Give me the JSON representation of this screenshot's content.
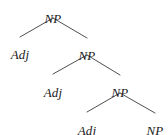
{
  "figure": {
    "name": "syntax-tree-diagram",
    "type": "constituency-tree",
    "background_color": "#ffffff",
    "edge_color": "#3a3a3a",
    "text_color": "#1a1a1a",
    "width": 168,
    "height": 135
  },
  "nodes": [
    {
      "id": "np1",
      "label": "NP",
      "depth": 0,
      "x": 53,
      "y": 12,
      "role": "root"
    },
    {
      "id": "adj1",
      "label": "Adj",
      "depth": 1,
      "x": 20,
      "y": 48,
      "role": "leaf"
    },
    {
      "id": "np2",
      "label": "NP",
      "depth": 1,
      "x": 87,
      "y": 49,
      "role": "branch"
    },
    {
      "id": "adj2",
      "label": "Adj",
      "depth": 2,
      "x": 53,
      "y": 86,
      "role": "leaf"
    },
    {
      "id": "np3",
      "label": "NP",
      "depth": 2,
      "x": 120,
      "y": 86,
      "role": "branch"
    },
    {
      "id": "adj3",
      "label": "Adj",
      "depth": 3,
      "x": 87,
      "y": 124,
      "role": "leaf"
    },
    {
      "id": "np4",
      "label": "NP",
      "depth": 3,
      "x": 155,
      "y": 124,
      "role": "leaf"
    }
  ],
  "edges": [
    {
      "id": "e1",
      "from": "np1",
      "to": "adj1",
      "x1": 53,
      "y1": 18,
      "x2": 20,
      "y2": 37
    },
    {
      "id": "e2",
      "from": "np1",
      "to": "np2",
      "x1": 53,
      "y1": 18,
      "x2": 87,
      "y2": 38
    },
    {
      "id": "e3",
      "from": "np2",
      "to": "adj2",
      "x1": 87,
      "y1": 55,
      "x2": 53,
      "y2": 74
    },
    {
      "id": "e4",
      "from": "np2",
      "to": "np3",
      "x1": 87,
      "y1": 55,
      "x2": 120,
      "y2": 75
    },
    {
      "id": "e5",
      "from": "np3",
      "to": "adj3",
      "x1": 120,
      "y1": 93,
      "x2": 87,
      "y2": 112
    },
    {
      "id": "e6",
      "from": "np3",
      "to": "np4",
      "x1": 120,
      "y1": 93,
      "x2": 155,
      "y2": 113
    }
  ]
}
